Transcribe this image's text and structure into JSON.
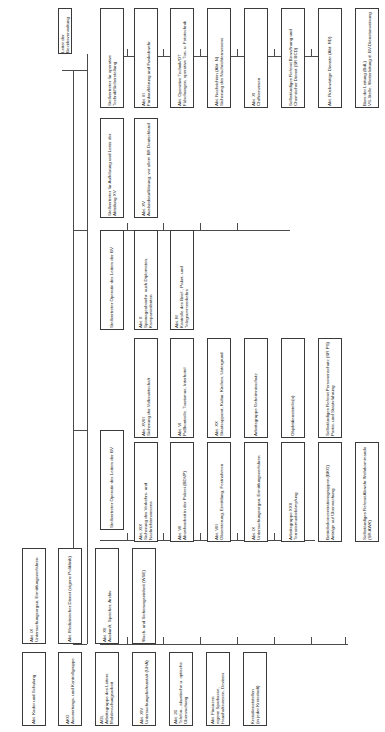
{
  "diagram": {
    "orientation": "rotated-text-90",
    "root": {
      "id": "root",
      "label": "Leiter der Bezirksverwaltung"
    },
    "deputies": [
      {
        "id": "dep-technik",
        "label": "Stellvertreter für operative Technik/Sicherstellung"
      },
      {
        "id": "dep-aufklaerung",
        "label": "Stellvertreter für Aufklärung und Leiter der Abteilung XV"
      },
      {
        "id": "dep-operativ-1",
        "label": "Stellvertreter Operativ des Leiters der BV"
      },
      {
        "id": "dep-operativ-2",
        "label": "Stellvertreter Operativ des Leiters der BV"
      }
    ],
    "units": [
      {
        "id": "u-abt-3",
        "label": "Abt. III\nFunkaufklärung und Funkabwehr"
      },
      {
        "id": "u-abt-ot",
        "label": "Abt. Operative Technik/OT\nFälschungen, operative Ton- u. Fototechnik"
      },
      {
        "id": "u-abt-n",
        "label": "Abt. Nachrichten (Abt. N)\nSicherung des Nachrichtenwesens"
      },
      {
        "id": "u-abt-xi",
        "label": "Abt. XI\nChiffrierwesen"
      },
      {
        "id": "u-sr-bcd",
        "label": "Selbständiges Referat Bewaffnung und Chemischer Dienst (SR BCD)"
      },
      {
        "id": "u-abt-rd",
        "label": "Abt. Rückwärtige Dienste (Abt. RD)"
      },
      {
        "id": "u-bdl",
        "label": "Büro der Leitung (BdL)\nVS-Stelle, Weiterleitung d. BV-Dienstanweisung"
      },
      {
        "id": "u-abt-xv",
        "label": "Abt. XV\nAuslandsaufklärung, vor allem BR Deutschland"
      },
      {
        "id": "u-abt-2",
        "label": "Abt. II\nSpionageabwehr: auch Diplomaten, Kompaniedenten"
      },
      {
        "id": "u-abt-m",
        "label": "Abt. M\nKontrolle des Brief-, Paket- und Telegrammverkehrs"
      },
      {
        "id": "u-abt-18",
        "label": "Abt. XVIII\nSicherung der Volkswirtschaft"
      },
      {
        "id": "u-abt-19",
        "label": "Abt. XIX\nSicherung des Verkehrs- und Nachrichtenwesens"
      },
      {
        "id": "u-abt-6",
        "label": "Abt. VI\nPaßkontrolle, Tourismus, Interhotel"
      },
      {
        "id": "u-abt-7",
        "label": "Abt. VII\nAbwehrarbeit in der Polizei (BDVP)"
      },
      {
        "id": "u-abt-20",
        "label": "Abt. XX\nStaatsapparat, Kultur, Kirchen, Untergrund"
      },
      {
        "id": "u-abt-8",
        "label": "Abt. VIII\nObservierung, Ermittlung, Festnahmen"
      },
      {
        "id": "u-ag-gs",
        "label": "Arbeitsgruppe Geheimnisschutz"
      },
      {
        "id": "u-abt-9",
        "label": "Abt. IX\nUntersuchungsorgan, Ermittlungsverfahren"
      },
      {
        "id": "u-ag-22",
        "label": "Arbeitsgruppe XXII\nTerrorismusbekämpfung"
      },
      {
        "id": "u-obj",
        "label": "Objektdienststelle(n)"
      },
      {
        "id": "u-bk",
        "label": "Betriebskonzentrationsgruppen (BKG)\nAnträge auf Überwachung"
      },
      {
        "id": "u-sr-ps",
        "label": "Selbständiges Referat Personenschutz (SR PS)\nPartei- und Staatsführung"
      },
      {
        "id": "u-sr-awk",
        "label": "Selbständiges Referat Abwehr Wehrkommando (SR AWK)"
      },
      {
        "id": "u-abt-9b",
        "label": "Abt. IX\nUntersuchungsorgan, Ermittlungsverfahren"
      },
      {
        "id": "u-kader",
        "label": "Abt. Kader und Schulung"
      },
      {
        "id": "u-med",
        "label": "Abt. Medizinischer Dienst (eigene Poliklinik)"
      },
      {
        "id": "u-akg",
        "label": "AKG\nAuswertungs- und Kontrollgruppe"
      },
      {
        "id": "u-abt-12",
        "label": "Abt. XII\nAuskunft, Speicher, Archiv"
      },
      {
        "id": "u-agl",
        "label": "AGL\nArbeitsgruppe des Leiters Mobilmachungsarbeit"
      },
      {
        "id": "u-wse",
        "label": "Wach- und Sicherungseinheit (WSE)"
      },
      {
        "id": "u-abt-14",
        "label": "Abt. XIV\nUntersuchungshaftanstalt (UHA)"
      },
      {
        "id": "u-abt-26",
        "label": "Abt. 26\nTelefon-, akustische u. optische Überwachung"
      },
      {
        "id": "u-finanzen",
        "label": "Abt. Finanzen\neigene Sparkasse, Haushaltswesen, Devisen"
      },
      {
        "id": "u-kds",
        "label": "Kreisdienststellen\n(in jeder Kreisstadt)"
      }
    ]
  }
}
